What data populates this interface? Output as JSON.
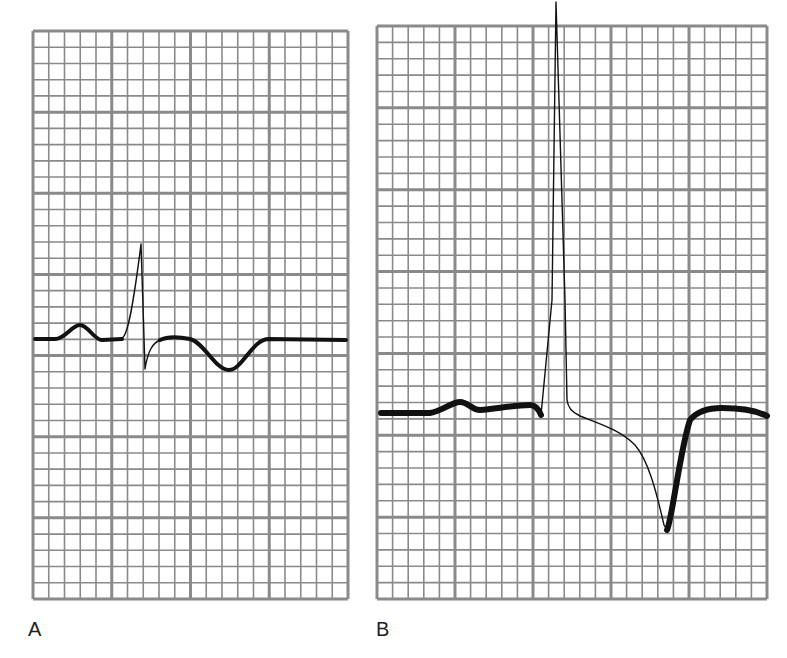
{
  "figure": {
    "grid_color": "#8a8a8a",
    "trace_color": "#111111",
    "background": "#ffffff"
  },
  "panels": [
    {
      "id": "A",
      "label": "A",
      "grid": {
        "x": 33,
        "y": 31,
        "width": 315,
        "height": 568,
        "major_cols": 4,
        "major_rows": 7,
        "minor_per_major": 5
      },
      "waveform": {
        "components": [
          "P wave (upright)",
          "QRS (small R, deep S)",
          "inverted T wave"
        ],
        "thin_path": "M 122 338 C 128 336, 134 300, 141 244 L 145 369 C 148 350, 153 343, 160 340",
        "thick_path_pre": "M 35 339 L 55 339 C 65 339, 72 325, 80 325 C 88 325, 94 340, 102 340 L 122 339",
        "thick_path_post": "M 160 340 C 168 336, 180 337, 190 339 C 205 343, 215 370, 229 370 C 242 370, 252 340, 268 339 L 346 340"
      }
    },
    {
      "id": "B",
      "label": "B",
      "grid": {
        "x": 377,
        "y": 26,
        "width": 390,
        "height": 573,
        "major_cols": 5,
        "major_rows": 7,
        "minor_per_major": 5
      },
      "waveform": {
        "components": [
          "P wave",
          "tall narrow R wave",
          "downsloping ST segment",
          "deep inverted T wave"
        ],
        "thin_path": "M 541 415 L 552 300 L 556 2 L 565 300 L 567 400 C 568 408, 572 412, 580 416 C 600 424, 620 430, 635 445 C 648 460, 656 490, 664 525 L 667 530",
        "thick_path_pre": "M 381 413 L 430 413 C 440 412, 452 402, 460 402 C 468 402, 472 410, 480 410 C 495 409, 515 405, 530 405 C 536 405, 539 410, 541 415",
        "thick_path_post": "M 667 530 C 672 520, 680 450, 690 420 C 698 410, 710 408, 722 408 C 740 408, 755 410, 767 416"
      }
    }
  ]
}
